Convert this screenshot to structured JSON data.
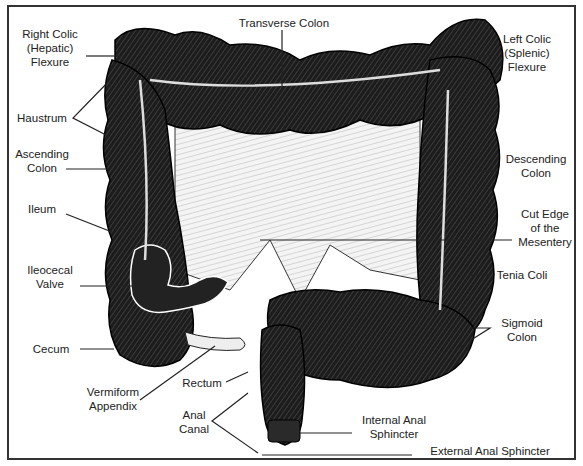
{
  "diagram": {
    "labels": {
      "right_colic_flexure": [
        "Right Colic",
        "(Hepatic)",
        "Flexure"
      ],
      "transverse_colon": "Transverse Colon",
      "left_colic_flexure": [
        "Left Colic",
        "(Splenic)",
        "Flexure"
      ],
      "haustrum": "Haustrum",
      "ascending_colon": [
        "Ascending",
        "Colon"
      ],
      "descending_colon": [
        "Descending",
        "Colon"
      ],
      "ileum": "Ileum",
      "cut_edge_mesentery": [
        "Cut Edge",
        "of the",
        "Mesentery"
      ],
      "ileocecal_valve": [
        "Ileocecal",
        "Valve"
      ],
      "tenia_coli": "Tenia Coli",
      "sigmoid_colon": [
        "Sigmoid",
        "Colon"
      ],
      "cecum": "Cecum",
      "vermiform_appendix": [
        "Vermiform",
        "Appendix"
      ],
      "rectum": "Rectum",
      "anal_canal": [
        "Anal",
        "Canal"
      ],
      "internal_anal_sphincter": [
        "Internal Anal",
        "Sphincter"
      ],
      "external_anal_sphincter": "External Anal Sphincter"
    },
    "colors": {
      "ink": "#1a1a1a",
      "border": "#333333",
      "background": "#ffffff",
      "mesentery": "#e8e8e8"
    }
  }
}
